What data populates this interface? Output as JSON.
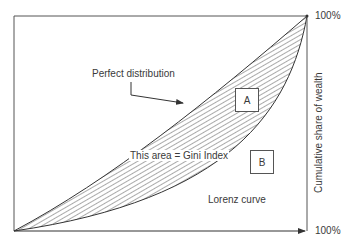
{
  "diagram": {
    "labels": {
      "perfect_distribution": "Perfect distribution",
      "gini_area": "This area = Gini Index",
      "lorenz_curve": "Lorenz curve",
      "area_a": "A",
      "area_b": "B",
      "y_axis": "Cumulative share of wealth",
      "y_max": "100%",
      "x_max": "100%"
    },
    "colors": {
      "line": "#404040",
      "hatch": "#555555",
      "text": "#3a3a3a",
      "background": "#ffffff"
    }
  }
}
